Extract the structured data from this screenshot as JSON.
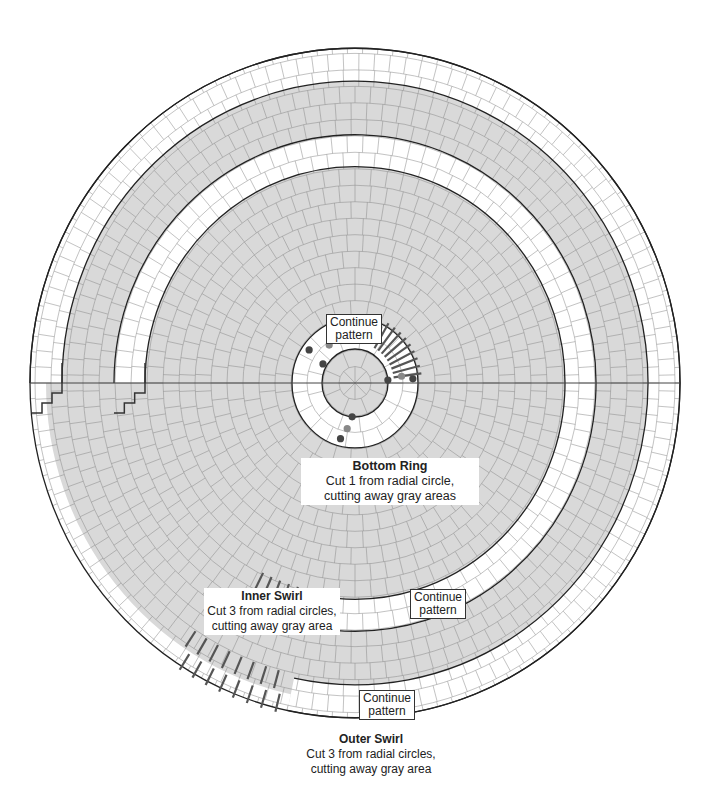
{
  "diagram": {
    "center": [
      355,
      383
    ],
    "y_scale": 1.03,
    "colors": {
      "gray": "#d9d9d9",
      "white": "#ffffff",
      "grid": "#8a8a8a",
      "line": "#222222",
      "cut": "#555555",
      "dot_dark": "#444444",
      "dot_light": "#888888"
    },
    "rings": {
      "outer_edge": 325,
      "outer_swirl": {
        "inner": 293,
        "outer": 325,
        "end_angle_deg": 102
      },
      "inner_swirl": {
        "inner": 210,
        "outer": 241,
        "end_angle_deg": 95
      },
      "bottom_ring": {
        "inner": 33,
        "outer": 63
      }
    }
  },
  "labels": {
    "bottom_ring": {
      "title": "Bottom Ring",
      "line1": "Cut 1 from radial circle,",
      "line2": "cutting away gray areas"
    },
    "inner_swirl": {
      "title": "Inner Swirl",
      "line1": "Cut 3 from radial circles,",
      "line2": "cutting away gray area"
    },
    "outer_swirl": {
      "title": "Outer Swirl",
      "line1": "Cut 3 from radial circles,",
      "line2": "cutting away gray area"
    }
  },
  "callouts": {
    "center": {
      "line1": "Continue",
      "line2": "pattern"
    },
    "inner": {
      "line1": "Continue",
      "line2": "pattern"
    },
    "outer": {
      "line1": "Continue",
      "line2": "pattern"
    }
  }
}
